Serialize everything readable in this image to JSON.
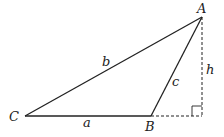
{
  "diagram": {
    "type": "triangle-with-altitude",
    "vertices": {
      "A": {
        "label": "A",
        "x": 202,
        "y": 17
      },
      "B": {
        "label": "B",
        "x": 151,
        "y": 116
      },
      "C": {
        "label": "C",
        "x": 25,
        "y": 116
      }
    },
    "foot": {
      "x": 202,
      "y": 116
    },
    "sides": {
      "a": {
        "label": "a"
      },
      "b": {
        "label": "b"
      },
      "c": {
        "label": "c"
      }
    },
    "altitude": {
      "label": "h"
    },
    "colors": {
      "line": "#222222",
      "background": "#ffffff"
    }
  }
}
